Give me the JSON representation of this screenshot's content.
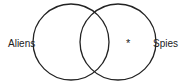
{
  "diagram": {
    "type": "venn",
    "sets": [
      {
        "label": "Aliens",
        "cx": 71,
        "cy": 42,
        "r": 38
      },
      {
        "label": "Spies",
        "cx": 118,
        "cy": 42,
        "r": 38
      }
    ],
    "marker": {
      "symbol": "*",
      "region": "Spies only"
    },
    "stroke_color": "#222222"
  }
}
